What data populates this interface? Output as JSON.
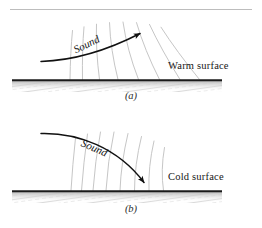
{
  "figure": {
    "title_rule": "top-divider",
    "background": "#ffffff",
    "panels": [
      {
        "id": "a",
        "label": "(a)",
        "surface_label": "Warm surface",
        "sound_label": "Sound",
        "description": "Sound refracts upward away from a warm surface",
        "ground_y": 80,
        "ground_x1": 12,
        "ground_x2": 222,
        "arrow_direction": "upward"
      },
      {
        "id": "b",
        "label": "(b)",
        "surface_label": "Cold surface",
        "sound_label": "Sound",
        "description": "Sound refracts downward toward a cold surface",
        "ground_y": 191,
        "ground_x1": 12,
        "ground_x2": 222,
        "arrow_direction": "downward"
      }
    ],
    "colors": {
      "ground_line": "#1b1b1b",
      "wavefront": "#c3c3c3",
      "ray_arrow": "#111111",
      "ground_texture": "#cfcfcf",
      "top_rule": "#bdbdbd",
      "text": "#171717"
    }
  }
}
